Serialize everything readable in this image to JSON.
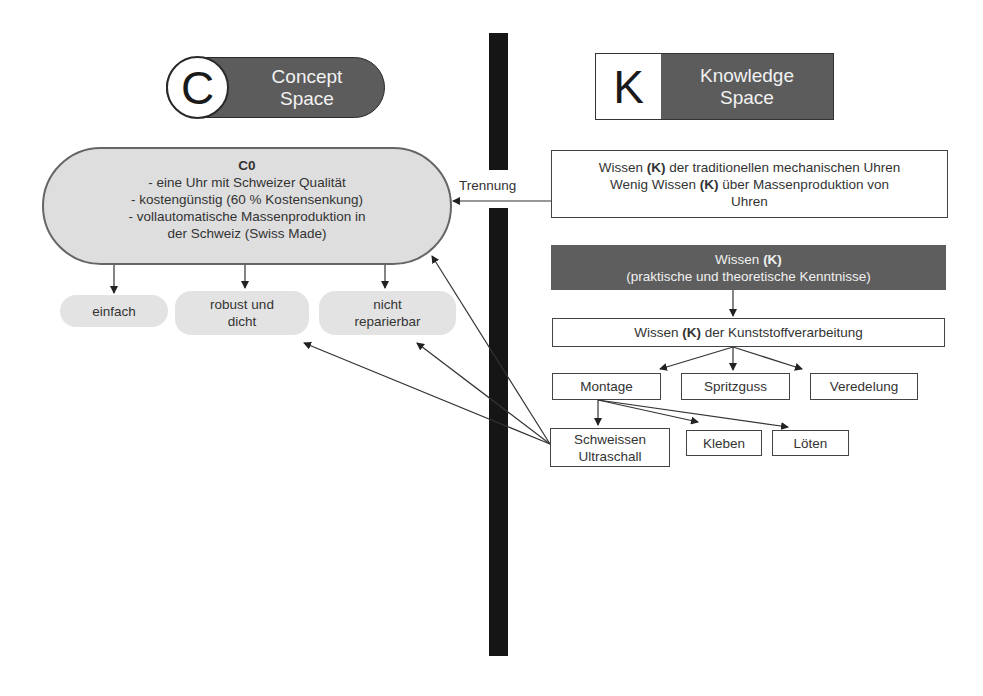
{
  "concept_space": {
    "letter": "C",
    "label_line1": "Concept",
    "label_line2": "Space"
  },
  "knowledge_space": {
    "letter": "K",
    "label_line1": "Knowledge",
    "label_line2": "Space"
  },
  "c0": {
    "title": "C0",
    "lines": [
      "- eine Uhr mit Schweizer Qualität",
      "- kostengünstig (60 % Kostensenkung)",
      "- vollautomatische Massenproduktion in",
      "der Schweiz (Swiss Made)"
    ]
  },
  "c_children": [
    {
      "line1": "einfach",
      "line2": ""
    },
    {
      "line1": "robust und",
      "line2": "dicht"
    },
    {
      "line1": "nicht",
      "line2": "reparierbar"
    }
  ],
  "separation_label": "Trennung",
  "k_existing": {
    "line1_pre": "Wissen ",
    "line1_bold": "(K)",
    "line1_post": " der traditionellen mechanischen Uhren",
    "line2_pre": "Wenig Wissen ",
    "line2_bold": "(K)",
    "line2_post": " über Massenproduktion von",
    "line3": "Uhren"
  },
  "k_root": {
    "line1_pre": "Wissen ",
    "line1_bold": "(K)",
    "line2": "(praktische und theoretische Kenntnisse)"
  },
  "k_plastic": {
    "pre": "Wissen ",
    "bold": "(K)",
    "post": " der Kunststoffverarbeitung"
  },
  "k_level2": [
    "Montage",
    "Spritzguss",
    "Veredelung"
  ],
  "k_level3": [
    {
      "line1": "Schweissen",
      "line2": "Ultraschall"
    },
    {
      "line1": "Kleben",
      "line2": ""
    },
    {
      "line1": "Löten",
      "line2": ""
    }
  ],
  "colors": {
    "divider": "#151515",
    "header_fill": "#5c5c5c",
    "pill_fill": "#dedede",
    "dark_box": "#5e5e5e"
  }
}
